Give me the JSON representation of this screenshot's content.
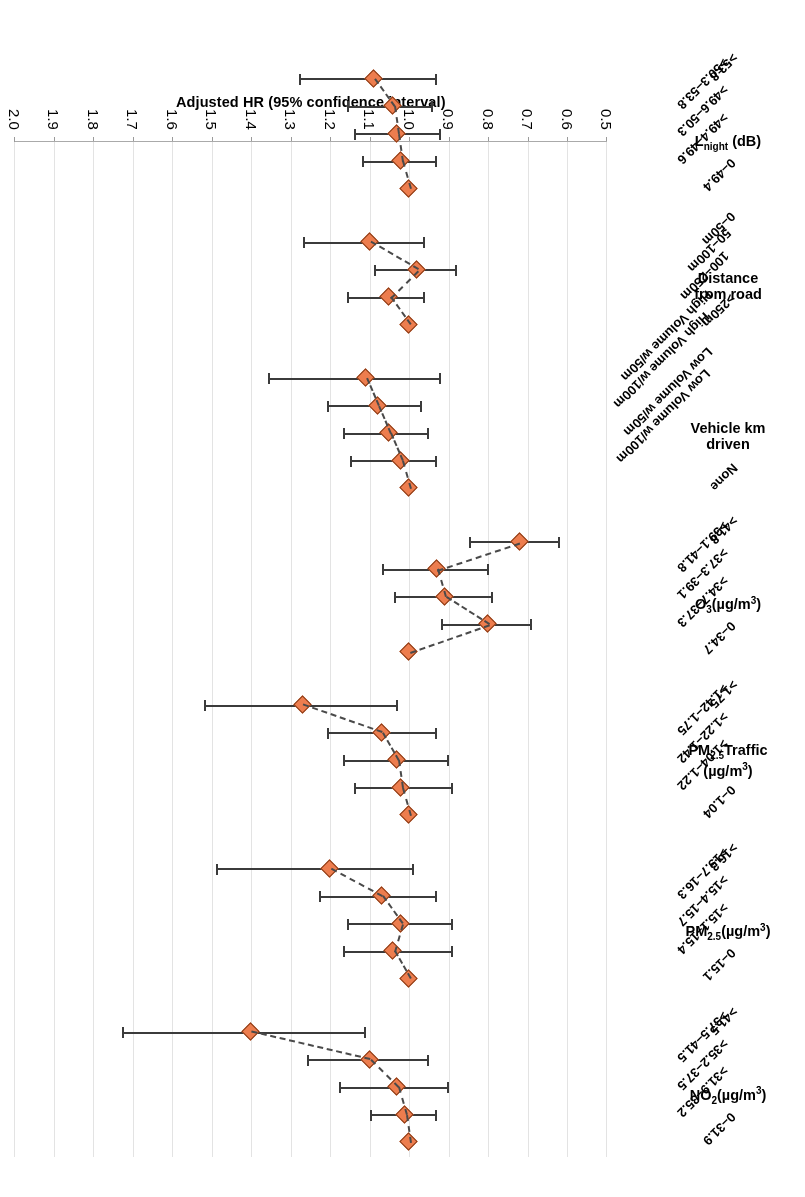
{
  "chart_data": {
    "type": "scatter",
    "title": "",
    "xlabel": "",
    "ylabel": "Adjusted HR (95% confidence interval)",
    "ylim": [
      0.5,
      2.0
    ],
    "ytick_labels": [
      "2.0",
      "1.9",
      "1.8",
      "1.7",
      "1.6",
      "1.5",
      "1.4",
      "1.3",
      "1.2",
      "1.1",
      "1.0",
      "0.9",
      "0.8",
      "0.7",
      "0.6",
      "0.5"
    ],
    "grid": true,
    "legend": "none",
    "marker_color": "#ed7d4e",
    "line_color": "#3b3b3b",
    "connector_style": "dashed",
    "groups": [
      {
        "name": "NO2(ug/m3)",
        "label_html": "NO<sub>2</sub>(µg/m<sup>3</sup>)",
        "categories": [
          "0–31.9",
          ">31.9–35.2",
          ">35.2–37.5",
          ">37.5–41.5",
          ">41.5"
        ],
        "values": [
          1.0,
          1.01,
          1.03,
          1.1,
          1.4
        ],
        "ci_low": [
          null,
          0.93,
          0.9,
          0.95,
          1.11
        ],
        "ci_high": [
          null,
          1.1,
          1.18,
          1.26,
          1.73
        ]
      },
      {
        "name": "PM2.5(ug/m3)",
        "label_html": "PM<sub>2.5</sub>(µg/m<sup>3</sup>)",
        "categories": [
          "0–15.1",
          ">15.1–15.4",
          ">15.4–15.7",
          ">15.7–16.3",
          ">16.3"
        ],
        "values": [
          1.0,
          1.04,
          1.02,
          1.07,
          1.2
        ],
        "ci_low": [
          null,
          0.89,
          0.89,
          0.93,
          0.99
        ],
        "ci_high": [
          null,
          1.17,
          1.16,
          1.23,
          1.49
        ]
      },
      {
        "name": "PM2.5 Traffic(ug/m3)",
        "label_html": "PM<sub>2.5</sub>Traffic<br>(µg/m<sup>3</sup>)",
        "categories": [
          "0–1.04",
          ">1.04–1.22",
          ">1.22–1.42",
          ">1.42–1.75",
          ">1.75"
        ],
        "values": [
          1.0,
          1.02,
          1.03,
          1.07,
          1.27
        ],
        "ci_low": [
          null,
          0.89,
          0.9,
          0.93,
          1.03
        ],
        "ci_high": [
          null,
          1.14,
          1.17,
          1.21,
          1.52
        ]
      },
      {
        "name": "O3(ug/m3)",
        "label_html": "O<sub>3</sub>(µg/m<sup>3</sup>)",
        "categories": [
          "0–34.7",
          ">34.7–37.3",
          ">37.3–39.1",
          ">39.1–41.8",
          ">41.8"
        ],
        "values": [
          1.0,
          0.8,
          0.91,
          0.93,
          0.72
        ],
        "ci_low": [
          null,
          0.69,
          0.79,
          0.8,
          0.62
        ],
        "ci_high": [
          null,
          0.92,
          1.04,
          1.07,
          0.85
        ]
      },
      {
        "name": "Vehicle km driven",
        "label_html": "Vehicle km<br>driven",
        "categories": [
          "None",
          "Low Volume w/100m",
          "Low Volume w/50m",
          "High Volume w/100m",
          "High Volume w/50m"
        ],
        "values": [
          1.0,
          1.02,
          1.05,
          1.08,
          1.11
        ],
        "ci_low": [
          null,
          0.93,
          0.95,
          0.97,
          0.92
        ],
        "ci_high": [
          null,
          1.15,
          1.17,
          1.21,
          1.36
        ]
      },
      {
        "name": "Distance from road",
        "label_html": "Distance<br>from road",
        "categories": [
          ">250m",
          "100–250m",
          "50–100m",
          "0–50m"
        ],
        "values": [
          1.0,
          1.05,
          0.98,
          1.1
        ],
        "ci_low": [
          null,
          0.96,
          0.88,
          0.96
        ],
        "ci_high": [
          null,
          1.16,
          1.09,
          1.27
        ]
      },
      {
        "name": "Lnight (dB)",
        "label_html": "L<sub>night</sub> (dB)",
        "categories": [
          "0–49.4",
          ">49.4–49.6",
          ">49.6–50.3",
          ">50.3–53.8",
          ">53.8"
        ],
        "values": [
          1.0,
          1.02,
          1.03,
          1.04,
          1.09
        ],
        "ci_low": [
          null,
          0.93,
          0.92,
          0.94,
          0.93
        ],
        "ci_high": [
          null,
          1.12,
          1.14,
          1.16,
          1.28
        ]
      }
    ]
  }
}
